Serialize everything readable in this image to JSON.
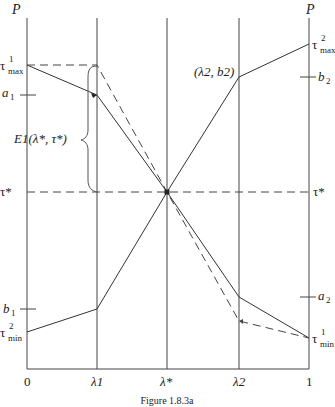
{
  "figure": {
    "caption": "Figure 1.8.3a",
    "left_axis_label": "P",
    "right_axis_label": "P",
    "x_ticks": [
      "0",
      "λ1",
      "λ*",
      "λ2",
      "1"
    ],
    "left_labels": {
      "tau_max": {
        "base": "τ",
        "sup": "1",
        "sub": "max"
      },
      "a": {
        "base": "a",
        "sub": "1"
      },
      "tau_star": "τ*",
      "b": {
        "base": "b",
        "sub": "1"
      },
      "tau_min": {
        "base": "τ",
        "sup": "2",
        "sub": "min"
      }
    },
    "right_labels": {
      "tau_max": {
        "base": "τ",
        "sup": "2",
        "sub": "max"
      },
      "b": {
        "base": "b",
        "sub": "2"
      },
      "tau_star": "τ*",
      "a": {
        "base": "a",
        "sub": "2"
      },
      "tau_min": {
        "base": "τ",
        "sup": "1",
        "sub": "min"
      }
    },
    "point_label": "(λ2, b2)",
    "brace_label": "E1(λ*, τ*)",
    "colors": {
      "line": "#333333",
      "axis": "#444444",
      "background": "#ffffff"
    }
  }
}
